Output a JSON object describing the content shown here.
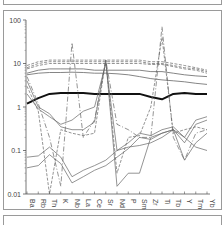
{
  "chart_data": {
    "type": "line",
    "title": "",
    "xlabel": "",
    "ylabel": "",
    "yscale": "log",
    "ylim": [
      0.01,
      100
    ],
    "grid": false,
    "legend": null,
    "y_ticks": [
      "100",
      "10",
      "1",
      "0.1",
      "0.01"
    ],
    "categories": [
      "Ba",
      "Rb",
      "Th",
      "K",
      "Nb",
      "La",
      "Ce",
      "Sr",
      "Nd",
      "P",
      "Sm",
      "Zr",
      "Ti",
      "Tb",
      "Y",
      "Tm",
      "Yb"
    ],
    "series": [
      {
        "name": "dashed-upper-1",
        "style": "dashed",
        "width": 0.7,
        "values": [
          9,
          11,
          12,
          12,
          12,
          12,
          12,
          12,
          12,
          12,
          12,
          11,
          11,
          10,
          9,
          8,
          7
        ]
      },
      {
        "name": "dashed-upper-2",
        "style": "dashed",
        "width": 0.7,
        "values": [
          8,
          10,
          11,
          11,
          11,
          11,
          11,
          11,
          11,
          11,
          11,
          10,
          10,
          9,
          8,
          7.5,
          6.5
        ]
      },
      {
        "name": "dashed-upper-3",
        "style": "dashed",
        "width": 0.7,
        "values": [
          7.5,
          9,
          10,
          10,
          10,
          10,
          10,
          10,
          10,
          10,
          10,
          9.5,
          9.5,
          8.5,
          7.5,
          7,
          6
        ]
      },
      {
        "name": "solid-upper-1",
        "style": "solid",
        "width": 0.8,
        "values": [
          6,
          7,
          7.5,
          7.5,
          7.5,
          7.5,
          7,
          7,
          7,
          7,
          7,
          6.5,
          6.5,
          6,
          5.5,
          5.2,
          5
        ]
      },
      {
        "name": "solid-upper-2",
        "style": "solid",
        "width": 0.8,
        "values": [
          5.5,
          6,
          6.2,
          6.2,
          6.3,
          6.2,
          6,
          6,
          5.8,
          5.5,
          5,
          4.5,
          4.2,
          4,
          3.8,
          3.5,
          3.3
        ]
      },
      {
        "name": "thick-main",
        "style": "solid",
        "width": 2.0,
        "values": [
          1.2,
          1.6,
          2.0,
          2.1,
          2.1,
          2.1,
          2.0,
          2.0,
          2.0,
          2.0,
          2.0,
          1.7,
          1.5,
          2.0,
          2.1,
          2.0,
          2.0
        ]
      },
      {
        "name": "solid-lower-1",
        "style": "solid",
        "width": 0.7,
        "values": [
          0.07,
          0.075,
          0.12,
          0.07,
          0.025,
          0.035,
          0.045,
          0.06,
          0.1,
          0.15,
          0.25,
          0.22,
          0.3,
          0.35,
          0.2,
          0.5,
          0.6
        ]
      },
      {
        "name": "solid-lower-2",
        "style": "solid",
        "width": 0.7,
        "values": [
          0.04,
          0.045,
          0.08,
          0.05,
          0.018,
          0.025,
          0.035,
          0.045,
          0.07,
          0.11,
          0.2,
          0.18,
          0.25,
          0.3,
          0.15,
          0.4,
          0.5
        ]
      },
      {
        "name": "dashdot-spiky",
        "style": "dashdot",
        "width": 0.7,
        "values": [
          5,
          1.2,
          0.2,
          0.015,
          30,
          0.2,
          0.5,
          12,
          0.4,
          0.3,
          0.2,
          0.2,
          70,
          0.2,
          0.06,
          0.25,
          0.3
        ]
      },
      {
        "name": "dashed-mid",
        "style": "dashed",
        "width": 0.7,
        "values": [
          3,
          0.8,
          0.01,
          0.3,
          0.25,
          0.22,
          0.25,
          12,
          0.03,
          0.2,
          0.22,
          1,
          40,
          0.25,
          0.3,
          0.35,
          0.3
        ]
      },
      {
        "name": "solid-descending",
        "style": "solid",
        "width": 0.7,
        "values": [
          4,
          1.0,
          0.7,
          0.35,
          0.3,
          0.3,
          0.45,
          12,
          0.015,
          0.03,
          0.03,
          0.2,
          0.25,
          0.3,
          0.06,
          0.15,
          0.25
        ]
      },
      {
        "name": "solid-mid-2",
        "style": "solid",
        "width": 0.7,
        "values": [
          2,
          0.9,
          0.6,
          0.4,
          0.5,
          0.8,
          1.0,
          10,
          0.1,
          0.12,
          0.13,
          0.15,
          0.2,
          0.3,
          0.2,
          0.12,
          0.1
        ]
      }
    ]
  }
}
